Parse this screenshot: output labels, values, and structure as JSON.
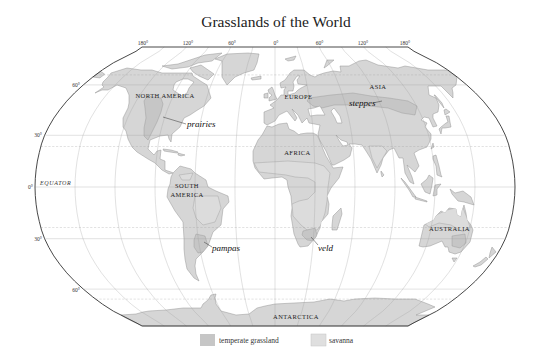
{
  "title": "Grasslands of the World",
  "graticule": {
    "longitude_labels": [
      "180°",
      "120°",
      "60°",
      "0°",
      "60°",
      "120°",
      "180°"
    ],
    "latitude_labels": [
      "60°",
      "30°",
      "0°",
      "30°",
      "60°"
    ],
    "equator_label": "EQUATOR"
  },
  "continents": {
    "north_america": "NORTH AMERICA",
    "south_america_line1": "SOUTH",
    "south_america_line2": "AMERICA",
    "europe": "EUROPE",
    "asia": "ASIA",
    "africa": "AFRICA",
    "australia": "AUSTRALIA",
    "antarctica": "ANTARCTICA"
  },
  "grasslands": {
    "prairies": "prairies",
    "steppes": "steppes",
    "pampas": "pampas",
    "veld": "veld"
  },
  "legend": {
    "items": [
      {
        "label": "temperate grassland",
        "color": "#c6c6c6"
      },
      {
        "label": "savanna",
        "color": "#dfdfdf"
      }
    ]
  },
  "colors": {
    "land": "#d6d6d6",
    "temperate_grassland": "#c6c6c6",
    "savanna": "#dcdcdc",
    "frame": "#333333"
  }
}
